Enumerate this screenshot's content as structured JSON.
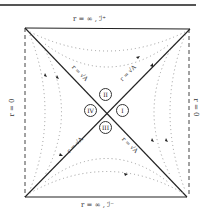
{
  "diagram": {
    "type": "penrose-carter",
    "boundaries": {
      "top": "r = ∞ , ℐ⁺",
      "bottom": "r = ∞ , ℐ⁻",
      "left": "r = 0",
      "right": "r = 0"
    },
    "horizons": {
      "top_left": "r = √A",
      "top_right": "r = √A",
      "bottom_left": "r = √A",
      "bottom_right": "r = √A"
    },
    "regions": {
      "top": "II",
      "left": "IV",
      "right": "I",
      "bottom": "III"
    },
    "colors": {
      "line": "#222222",
      "dotted": "#9a9a9a",
      "background": "#ffffff"
    }
  }
}
